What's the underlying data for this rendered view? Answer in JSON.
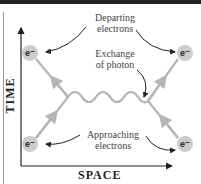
{
  "diagram": {
    "axes": {
      "x_label": "SPACE",
      "y_label": "TIME"
    },
    "labels": {
      "departing": "Departing electrons",
      "departing_l1": "Departing",
      "departing_l2": "electrons",
      "exchange_l1": "Exchange",
      "exchange_l2": "of photon",
      "approaching_l1": "Approaching",
      "approaching_l2": "electrons"
    },
    "particles": [
      {
        "symbol": "e⁻",
        "position": "top-left"
      },
      {
        "symbol": "e⁻",
        "position": "top-right"
      },
      {
        "symbol": "e⁻",
        "position": "bottom-left"
      },
      {
        "symbol": "e⁻",
        "position": "bottom-right"
      }
    ],
    "colors": {
      "line": "#b5b5b5",
      "electron": "#cccccc",
      "arrow": "#222222",
      "topbar": "#222222"
    }
  }
}
